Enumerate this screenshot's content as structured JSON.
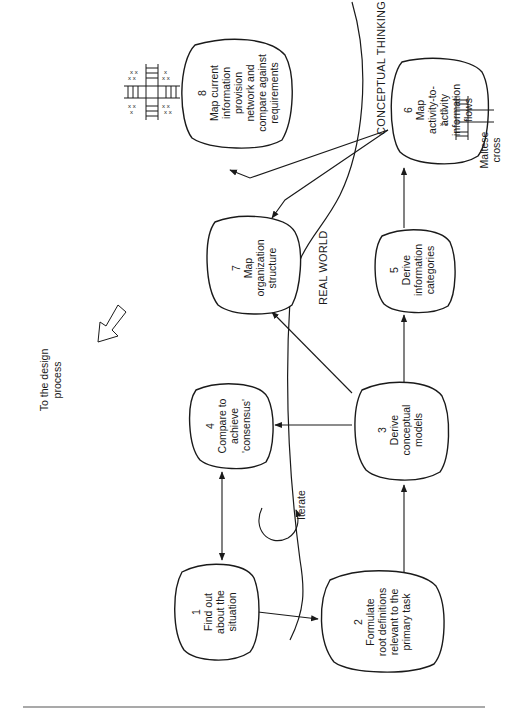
{
  "diagram": {
    "regions": {
      "real_world": "REAL WORLD",
      "conceptual_thinking": "CONCEPTUAL THINKING"
    },
    "nodes": [
      {
        "id": 1,
        "number": "1",
        "lines": [
          "Find out",
          "about the",
          "situation"
        ]
      },
      {
        "id": 2,
        "number": "2",
        "lines": [
          "Formulate",
          "root definitions",
          "relevant to the",
          "primary task"
        ]
      },
      {
        "id": 3,
        "number": "3",
        "lines": [
          "Derive",
          "conceptual",
          "models"
        ]
      },
      {
        "id": 4,
        "number": "4",
        "lines": [
          "Compare to",
          "achieve",
          "'consensus'"
        ]
      },
      {
        "id": 5,
        "number": "5",
        "lines": [
          "Derive",
          "information",
          "categories"
        ]
      },
      {
        "id": 6,
        "number": "6",
        "lines": [
          "Map",
          "activity-to-",
          "activity",
          "information",
          "flows"
        ]
      },
      {
        "id": 7,
        "number": "7",
        "lines": [
          "Map",
          "organization",
          "structure"
        ]
      },
      {
        "id": 8,
        "number": "8",
        "lines": [
          "Map current",
          "information",
          "provision",
          "network and",
          "compare against",
          "requirements"
        ]
      }
    ],
    "annotations": {
      "iterate": "Iterate",
      "maltese_cross": [
        "Maltese",
        "cross"
      ],
      "design_process": [
        "To the design",
        "process"
      ]
    },
    "edges": [
      {
        "from": 1,
        "to": 2
      },
      {
        "from": 1,
        "to": 4,
        "bidirectional": true
      },
      {
        "from": 2,
        "to": 3
      },
      {
        "from": 3,
        "to": 4
      },
      {
        "from": 3,
        "to": 5
      },
      {
        "from": 3,
        "to": 7
      },
      {
        "from": 5,
        "to": 6
      },
      {
        "from": 6,
        "to": 7
      },
      {
        "from": 6,
        "to": 8
      }
    ],
    "colors": {
      "ink": "#1a1a1a",
      "paper": "#ffffff",
      "rule": "#555555"
    }
  }
}
